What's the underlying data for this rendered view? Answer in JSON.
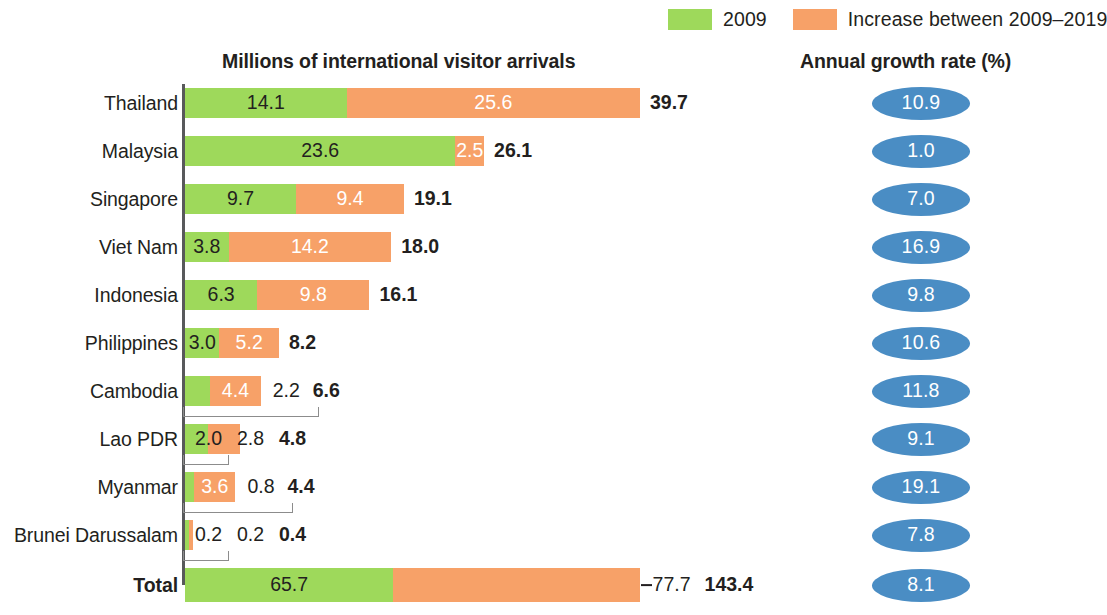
{
  "legend": {
    "items": [
      {
        "label": "2009",
        "color": "#9ED95B",
        "icon": "legend-swatch"
      },
      {
        "label": "Increase between 2009–2019",
        "color": "#F7A168",
        "icon": "legend-swatch"
      }
    ]
  },
  "headers": {
    "left": "Millions of international visitor arrivals",
    "right": "Annual growth rate (%)"
  },
  "chart_data": {
    "type": "bar",
    "title": "Millions of international visitor arrivals",
    "subtitle": "",
    "xlabel": "",
    "ylabel": "",
    "orientation": "horizontal",
    "stacked": true,
    "grid": false,
    "legend_position": "top-right",
    "axis_note": "Total row drawn on a compressed scale",
    "categories": [
      "Thailand",
      "Malaysia",
      "Singapore",
      "Viet Nam",
      "Indonesia",
      "Philippines",
      "Cambodia",
      "Lao PDR",
      "Myanmar",
      "Brunei Darussalam",
      "Total"
    ],
    "series": [
      {
        "name": "2009",
        "color": "#9ED95B",
        "values": [
          14.1,
          23.6,
          9.7,
          3.8,
          6.3,
          3.0,
          2.2,
          2.0,
          0.8,
          0.2,
          65.7
        ]
      },
      {
        "name": "Increase between 2009–2019",
        "color": "#F7A168",
        "values": [
          25.6,
          2.5,
          9.4,
          14.2,
          9.8,
          5.2,
          4.4,
          2.8,
          3.6,
          0.2,
          77.7
        ]
      }
    ],
    "totals": [
      39.7,
      26.1,
      19.1,
      18.0,
      16.1,
      8.2,
      6.6,
      4.8,
      4.4,
      0.4,
      143.4
    ],
    "annual_growth_rate_percent": [
      10.9,
      1.0,
      7.0,
      16.9,
      9.8,
      10.6,
      11.8,
      9.1,
      19.1,
      7.8,
      8.1
    ]
  },
  "rows": [
    {
      "country": "Thailand",
      "green": "14.1",
      "orange": "25.6",
      "total": "39.7",
      "growth": "10.9"
    },
    {
      "country": "Malaysia",
      "green": "23.6",
      "orange": "2.5",
      "total": "26.1",
      "growth": "1.0"
    },
    {
      "country": "Singapore",
      "green": "9.7",
      "orange": "9.4",
      "total": "19.1",
      "growth": "7.0"
    },
    {
      "country": "Viet Nam",
      "green": "3.8",
      "orange": "14.2",
      "total": "18.0",
      "growth": "16.9"
    },
    {
      "country": "Indonesia",
      "green": "6.3",
      "orange": "9.8",
      "total": "16.1",
      "growth": "9.8"
    },
    {
      "country": "Philippines",
      "green": "3.0",
      "orange": "5.2",
      "total": "8.2",
      "growth": "10.6"
    },
    {
      "country": "Cambodia",
      "green": "2.2",
      "orange": "4.4",
      "total": "6.6",
      "growth": "11.8"
    },
    {
      "country": "Lao PDR",
      "green": "2.0",
      "orange": "2.8",
      "total": "4.8",
      "growth": "9.1"
    },
    {
      "country": "Myanmar",
      "green": "0.8",
      "orange": "3.6",
      "total": "4.4",
      "growth": "19.1"
    },
    {
      "country": "Brunei Darussalam",
      "green": "0.2",
      "orange": "0.2",
      "total": "0.4",
      "growth": "7.8"
    },
    {
      "country": "Total",
      "green": "65.7",
      "orange": "77.7",
      "total": "143.4",
      "growth": "8.1"
    }
  ]
}
